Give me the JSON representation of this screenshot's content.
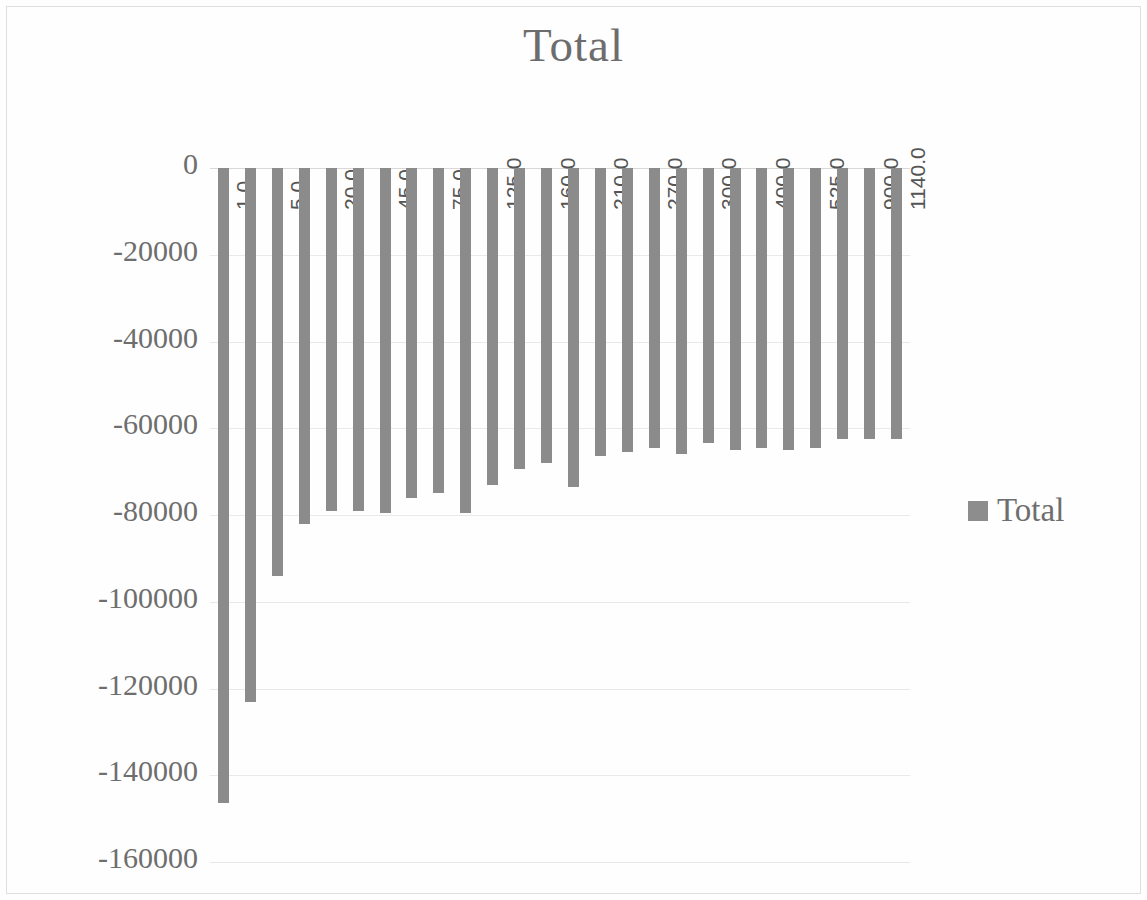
{
  "chart": {
    "title": "Total",
    "legend": {
      "position": "right",
      "entries": [
        {
          "label": "Total",
          "color": "#8b8b8b"
        }
      ]
    },
    "colors": {
      "series": "#8b8b8b",
      "grid": "#e9e9e9",
      "text": "#6e6e6e"
    }
  },
  "chart_data": {
    "type": "bar",
    "title": "Total",
    "xlabel": "",
    "ylabel": "",
    "ylim": [
      -160000,
      0
    ],
    "ytick_labels": [
      "0",
      "-20000",
      "-40000",
      "-60000",
      "-80000",
      "-100000",
      "-120000",
      "-140000",
      "-160000"
    ],
    "ytick_values": [
      0,
      -20000,
      -40000,
      -60000,
      -80000,
      -100000,
      -120000,
      -140000,
      -160000
    ],
    "grid": true,
    "legend_position": "right",
    "categories": [
      "1.0",
      "",
      "5.0",
      "",
      "20.0",
      "",
      "45.0",
      "",
      "75.0",
      "",
      "125.0",
      "",
      "160.0",
      "",
      "210.0",
      "",
      "270.0",
      "",
      "300.0",
      "",
      "400.0",
      "",
      "525.0",
      "",
      "900.0",
      "1140.0"
    ],
    "series": [
      {
        "name": "Total",
        "values": [
          -146500,
          -123000,
          -94000,
          -82000,
          -79000,
          -79000,
          -79500,
          -76000,
          -75000,
          -79500,
          -73000,
          -69500,
          -68000,
          -73500,
          -66500,
          -65500,
          -64500,
          -66000,
          -63500,
          -65000,
          -64500,
          -65000,
          -64500,
          -62500,
          -62500,
          -62500
        ]
      }
    ]
  },
  "bar_labels": [
    {
      "index": 0,
      "text": "1.0"
    },
    {
      "index": 2,
      "text": "5.0"
    },
    {
      "index": 4,
      "text": "20.0"
    },
    {
      "index": 6,
      "text": "45.0"
    },
    {
      "index": 8,
      "text": "75.0"
    },
    {
      "index": 10,
      "text": "125.0"
    },
    {
      "index": 12,
      "text": "160.0"
    },
    {
      "index": 14,
      "text": "210.0"
    },
    {
      "index": 16,
      "text": "270.0"
    },
    {
      "index": 18,
      "text": "300.0"
    },
    {
      "index": 20,
      "text": "400.0"
    },
    {
      "index": 22,
      "text": "525.0"
    },
    {
      "index": 24,
      "text": "900.0"
    },
    {
      "index": 25,
      "text": "1140.0"
    }
  ]
}
